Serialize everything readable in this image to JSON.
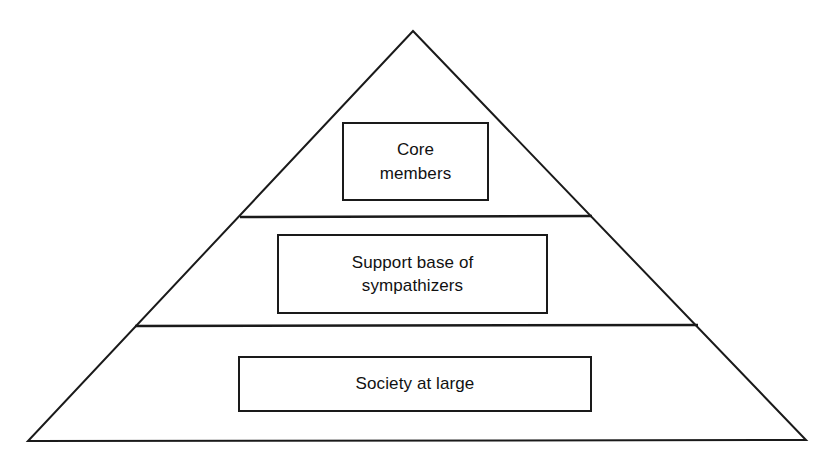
{
  "diagram": {
    "type": "pyramid",
    "title": "",
    "background_color": "#ffffff",
    "stroke_color": "#1a1a1a",
    "text_color": "#111111",
    "apex": {
      "x": 413,
      "y": 31
    },
    "base_left": {
      "x": 28,
      "y": 441
    },
    "base_right": {
      "x": 806,
      "y": 440
    },
    "dividers": [
      {
        "name": "divider-upper",
        "x1": 240,
        "y1": 217,
        "x2": 592,
        "y2": 216
      },
      {
        "name": "divider-lower",
        "x1": 135,
        "y1": 326,
        "x2": 698,
        "y2": 325
      }
    ],
    "tiers": [
      {
        "id": "core",
        "level": 1,
        "position": "top",
        "label": "Core\nmembers",
        "label_lines": [
          "Core",
          "members"
        ]
      },
      {
        "id": "support",
        "level": 2,
        "position": "middle",
        "label": "Support base of\nsympathizers",
        "label_lines": [
          "Support base of",
          "sympathizers"
        ]
      },
      {
        "id": "society",
        "level": 3,
        "position": "bottom",
        "label": "Society at large",
        "label_lines": [
          "Society at large"
        ]
      }
    ]
  }
}
